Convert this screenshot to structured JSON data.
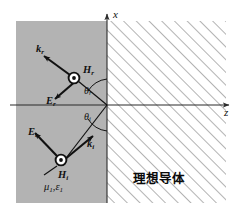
{
  "figure": {
    "canvas": {
      "width": 241,
      "height": 215
    },
    "colors": {
      "medium_fill": "#b3b3b3",
      "hatch_stroke": "#7a7a7a",
      "axis": "#2b2b2b",
      "vector": "#111111",
      "background": "#ffffff",
      "text": "#111111"
    }
  },
  "axes": {
    "x_label": "x",
    "z_label": "z",
    "origin_label": ""
  },
  "regions": {
    "left_medium": {
      "name": "medium-1",
      "material_label": "μ",
      "material_sub_1": "1",
      "material_sep": ",",
      "material_label_2": "ε",
      "material_sub_2": "1",
      "fill": "#b3b3b3"
    },
    "right_medium": {
      "name": "perfect-conductor",
      "label": "理想导体",
      "hatch": "diagonal"
    }
  },
  "reflected_wave": {
    "k_symbol": "k",
    "k_sub": "r",
    "e_symbol": "E",
    "e_sub": "r",
    "h_symbol": "H",
    "h_sub": "r",
    "angle_symbol": "θ",
    "angle_sub": "r",
    "h_direction": "out-of-page"
  },
  "incident_wave": {
    "k_symbol": "k",
    "k_sub": "i",
    "e_symbol": "E",
    "e_sub": "i",
    "h_symbol": "H",
    "h_sub": "i",
    "angle_symbol": "θ",
    "angle_sub": "i",
    "h_direction": "out-of-page"
  }
}
